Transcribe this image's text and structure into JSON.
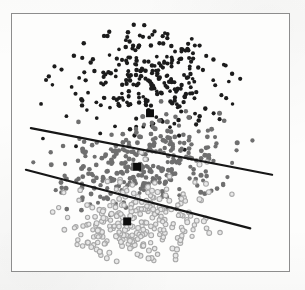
{
  "figure": {
    "title": "",
    "frame": {
      "x": 11,
      "y": 13,
      "width": 279,
      "height": 259,
      "border_color": "#8d8d8d"
    },
    "background_color": "#fdfdfc"
  },
  "chart_data": {
    "type": "scatter",
    "title": "",
    "subtitle": "",
    "xlabel": "",
    "ylabel": "",
    "xlim": [
      0,
      279
    ],
    "ylim": [
      0,
      259
    ],
    "grid": false,
    "legend": null,
    "axis_ticks": {
      "x": [],
      "y": []
    },
    "annotations": [],
    "series": [
      {
        "name": "cluster-1-dark",
        "color": "#1c1c1c",
        "marker": "circle",
        "marker_size": 4.1,
        "point_count": 270,
        "centroid": [
          139,
          100
        ],
        "distribution": {
          "shape": "band",
          "cx": 138,
          "cy": 62,
          "sx": 72,
          "sy": 46,
          "rotation_deg": -11
        }
      },
      {
        "name": "cluster-2-medium-gray",
        "color": "#6f6f6f",
        "marker": "circle",
        "marker_size": 4.6,
        "point_count": 300,
        "centroid": [
          126,
          154
        ],
        "distribution": {
          "shape": "band",
          "cx": 130,
          "cy": 150,
          "sx": 78,
          "sy": 32,
          "rotation_deg": -11
        }
      },
      {
        "name": "cluster-3-light-gray",
        "color": "#a8a8a8",
        "marker": "circle-outline",
        "marker_size": 4.6,
        "point_count": 260,
        "centroid": [
          116,
          209
        ],
        "distribution": {
          "shape": "band",
          "cx": 122,
          "cy": 212,
          "sx": 70,
          "sy": 32,
          "rotation_deg": -11
        }
      }
    ],
    "decision_boundaries": [
      {
        "name": "boundary-upper",
        "x1": 19,
        "y1": 115,
        "x2": 262,
        "y2": 162,
        "color": "#161616",
        "width": 2.2
      },
      {
        "name": "boundary-lower",
        "x1": 14,
        "y1": 157,
        "x2": 240,
        "y2": 216,
        "color": "#161616",
        "width": 2.2
      }
    ],
    "centroid_markers": [
      {
        "name": "centroid-cluster-1",
        "x": 139,
        "y": 100,
        "size": 8,
        "color": "#0e0e0e",
        "marker": "square"
      },
      {
        "name": "centroid-cluster-2",
        "x": 126,
        "y": 154,
        "size": 8,
        "color": "#0e0e0e",
        "marker": "square"
      },
      {
        "name": "centroid-cluster-3",
        "x": 116,
        "y": 209,
        "size": 8,
        "color": "#0e0e0e",
        "marker": "square"
      }
    ]
  }
}
